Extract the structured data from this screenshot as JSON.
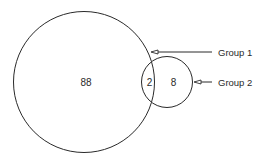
{
  "diagram": {
    "type": "venn",
    "sets": [
      {
        "name": "Group 1",
        "only_count": "88"
      },
      {
        "name": "Group 2",
        "only_count": "8"
      }
    ],
    "intersection_count": "2",
    "labels": {
      "group1": "Group 1",
      "group2": "Group 2"
    },
    "values": {
      "group1_only": "88",
      "intersection": "2",
      "group2_only": "8"
    },
    "colors": {
      "stroke": "#2a2a2a",
      "background": "#ffffff"
    }
  }
}
